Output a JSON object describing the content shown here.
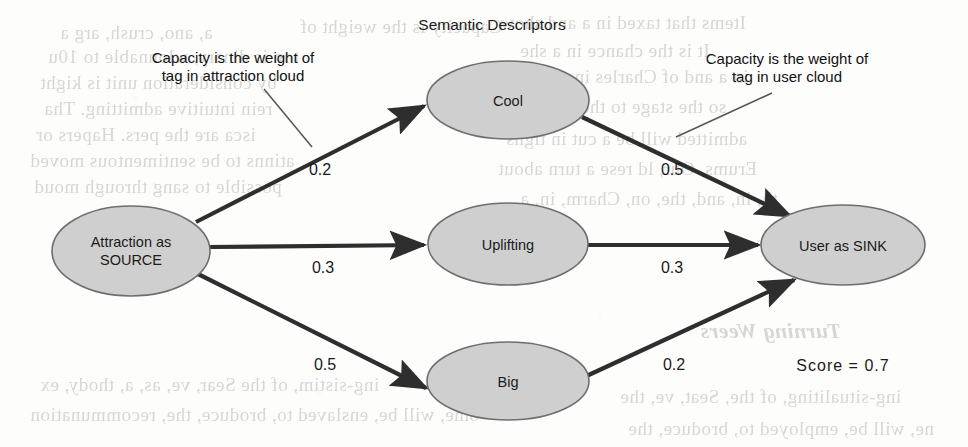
{
  "page": {
    "title": "Semantic Descriptors",
    "background_color": "#fdfdfc",
    "node_fill_color": "#cfcfcf",
    "node_stroke_color": "#6e6e6e",
    "edge_color": "#2e2e2e",
    "text_color": "#1b1b1b"
  },
  "nodes": {
    "source": {
      "label_line1": "Attraction as",
      "label_line2": "SOURCE"
    },
    "tag_cool": {
      "label": "Cool"
    },
    "tag_uplifting": {
      "label": "Uplifting"
    },
    "tag_big": {
      "label": "Big"
    },
    "sink": {
      "label": "User as SINK"
    }
  },
  "edges": {
    "source_to_cool": {
      "weight": "0.2"
    },
    "source_to_uplifting": {
      "weight": "0.3"
    },
    "source_to_big": {
      "weight": "0.5"
    },
    "cool_to_sink": {
      "weight": "0.5"
    },
    "uplifting_to_sink": {
      "weight": "0.3"
    },
    "big_to_sink": {
      "weight": "0.2"
    }
  },
  "annotations": {
    "left": {
      "line1": "Capacity is the weight of",
      "line2": "tag in attraction cloud"
    },
    "right": {
      "line1": "Capacity is the weight of",
      "line2": "tag in user cloud"
    }
  },
  "score": {
    "text": "Score  =  0.7"
  },
  "ghost_text": [
    {
      "t": "a, ano, crush, arg a",
      "x": 60,
      "y": 22
    },
    {
      "t": "Capacity is the weight of",
      "x": 300,
      "y": 16
    },
    {
      "t": "ton is dinary, wlonnable to 10u",
      "x": 48,
      "y": 46
    },
    {
      "t": "by consideration unit is kight",
      "x": 40,
      "y": 72
    },
    {
      "t": "rein intuitive admitting. Tha",
      "x": 44,
      "y": 98
    },
    {
      "t": "isca  are  the  pers.  Hapers  or",
      "x": 36,
      "y": 124
    },
    {
      "t": "atinns to be sentimentous moved",
      "x": 30,
      "y": 150
    },
    {
      "t": "possible to sang through moud",
      "x": 34,
      "y": 176
    },
    {
      "t": "Items that taxed in a and show",
      "x": 500,
      "y": 12
    },
    {
      "t": "It is the chance in a she",
      "x": 520,
      "y": 40
    },
    {
      "t": "in a and of Charles in a",
      "x": 560,
      "y": 66
    },
    {
      "t": "so the stage to the mod",
      "x": 540,
      "y": 96
    },
    {
      "t": "admitted will be a cut in tigns",
      "x": 506,
      "y": 128
    },
    {
      "t": "Erums, Our, ld rese a turn about",
      "x": 498,
      "y": 158
    },
    {
      "t": "th, in, and, the, on, Charm, in, a",
      "x": 520,
      "y": 188
    },
    {
      "t": "Turning Weers",
      "x": 700,
      "y": 318,
      "big": true,
      "it": true
    },
    {
      "t": "ing-sistim, of the Sear, ve, as, a, thody, ex",
      "x": 40,
      "y": 374
    },
    {
      "t": "ome, will be, enslaved to, broduce, the, recommunation",
      "x": 30,
      "y": 404
    },
    {
      "t": "ing-situaliting, of the, Seat, ve, the",
      "x": 620,
      "y": 386
    },
    {
      "t": "ne, will be, employed to, broduce, the",
      "x": 628,
      "y": 418
    }
  ]
}
